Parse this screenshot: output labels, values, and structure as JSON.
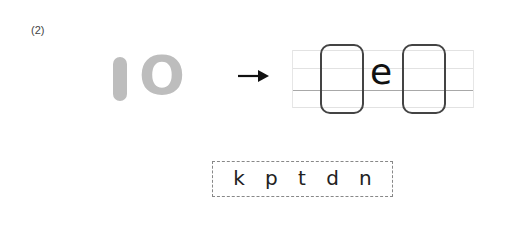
{
  "problem": {
    "number_label": "(2)",
    "given_word": [
      "I",
      "O"
    ],
    "given_color": "#bdbdbd",
    "arrow": "right-arrow",
    "answer_template": {
      "slots": [
        "",
        "e",
        ""
      ],
      "fixed_letter": "e"
    },
    "choices": [
      "k",
      "p",
      "t",
      "d",
      "n"
    ]
  }
}
